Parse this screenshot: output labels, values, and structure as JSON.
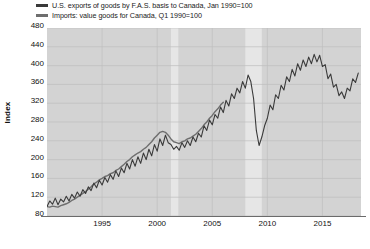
{
  "chart_data": {
    "type": "line",
    "title": "",
    "xlabel": "",
    "ylabel": "Index",
    "ylim": [
      80,
      480
    ],
    "xlim": [
      1990,
      2018.5
    ],
    "grid": true,
    "legend_position": "top-left",
    "yticks": [
      80,
      120,
      160,
      200,
      240,
      280,
      320,
      360,
      400,
      440,
      480
    ],
    "xticks": [
      1995,
      2000,
      2005,
      2010,
      2015
    ],
    "plot_background": "#d3d3d3",
    "gridline_color": "#bfbfbf",
    "recession_bands": [
      {
        "start": 2001.25,
        "end": 2001.92,
        "color": "#e6e6e6"
      },
      {
        "start": 2008.0,
        "end": 2009.5,
        "color": "#e6e6e6"
      }
    ],
    "series": [
      {
        "name": "U.S. exports of goods by F.A.S. basis to Canada, Jan 1990=100",
        "color": "#3a3a3a",
        "width": 1.1,
        "x": [
          1990.0,
          1990.25,
          1990.5,
          1990.75,
          1991.0,
          1991.25,
          1991.5,
          1991.75,
          1992.0,
          1992.25,
          1992.5,
          1992.75,
          1993.0,
          1993.25,
          1993.5,
          1993.75,
          1994.0,
          1994.25,
          1994.5,
          1994.75,
          1995.0,
          1995.25,
          1995.5,
          1995.75,
          1996.0,
          1996.25,
          1996.5,
          1996.75,
          1997.0,
          1997.25,
          1997.5,
          1997.75,
          1998.0,
          1998.25,
          1998.5,
          1998.75,
          1999.0,
          1999.25,
          1999.5,
          1999.75,
          2000.0,
          2000.25,
          2000.5,
          2000.75,
          2001.0,
          2001.25,
          2001.5,
          2001.75,
          2002.0,
          2002.25,
          2002.5,
          2002.75,
          2003.0,
          2003.25,
          2003.5,
          2003.75,
          2004.0,
          2004.25,
          2004.5,
          2004.75,
          2005.0,
          2005.25,
          2005.5,
          2005.75,
          2006.0,
          2006.25,
          2006.5,
          2006.75,
          2007.0,
          2007.25,
          2007.5,
          2007.75,
          2008.0,
          2008.25,
          2008.5,
          2008.75,
          2009.0,
          2009.25,
          2009.5,
          2009.75,
          2010.0,
          2010.25,
          2010.5,
          2010.75,
          2011.0,
          2011.25,
          2011.5,
          2011.75,
          2012.0,
          2012.25,
          2012.5,
          2012.75,
          2013.0,
          2013.25,
          2013.5,
          2013.75,
          2014.0,
          2014.25,
          2014.5,
          2014.75,
          2015.0,
          2015.25,
          2015.5,
          2015.75,
          2016.0,
          2016.25,
          2016.5,
          2016.75,
          2017.0,
          2017.25,
          2017.5,
          2017.75,
          2018.0,
          2018.25
        ],
        "values": [
          100,
          112,
          105,
          118,
          104,
          116,
          110,
          122,
          112,
          126,
          118,
          131,
          122,
          136,
          128,
          142,
          134,
          150,
          140,
          156,
          146,
          162,
          152,
          168,
          158,
          176,
          164,
          182,
          172,
          192,
          180,
          200,
          186,
          206,
          192,
          214,
          200,
          222,
          208,
          232,
          218,
          244,
          230,
          252,
          236,
          232,
          222,
          228,
          220,
          236,
          226,
          240,
          230,
          248,
          238,
          256,
          248,
          272,
          262,
          284,
          274,
          296,
          288,
          312,
          300,
          326,
          314,
          340,
          330,
          352,
          342,
          366,
          352,
          380,
          366,
          330,
          262,
          230,
          248,
          272,
          288,
          316,
          306,
          338,
          330,
          358,
          348,
          376,
          366,
          392,
          378,
          404,
          390,
          412,
          398,
          418,
          404,
          424,
          408,
          422,
          398,
          402,
          372,
          382,
          354,
          360,
          336,
          344,
          330,
          352,
          346,
          372,
          364,
          384
        ]
      },
      {
        "name": "Imports: value goods for Canada, Q1 1990=100",
        "color": "#6e6e6e",
        "width": 1.4,
        "x": [
          1990.0,
          1990.25,
          1990.5,
          1990.75,
          1991.0,
          1991.25,
          1991.5,
          1991.75,
          1992.0,
          1992.25,
          1992.5,
          1992.75,
          1993.0,
          1993.25,
          1993.5,
          1993.75,
          1994.0,
          1994.25,
          1994.5,
          1994.75,
          1995.0,
          1995.25,
          1995.5,
          1995.75,
          1996.0,
          1996.25,
          1996.5,
          1996.75,
          1997.0,
          1997.25,
          1997.5,
          1997.75,
          1998.0,
          1998.25,
          1998.5,
          1998.75,
          1999.0,
          1999.25,
          1999.5,
          1999.75,
          2000.0,
          2000.25,
          2000.5,
          2000.75,
          2001.0,
          2001.25,
          2001.5,
          2001.75,
          2002.0,
          2002.25,
          2002.5,
          2002.75,
          2003.0,
          2003.25,
          2003.5,
          2003.75,
          2004.0,
          2004.25,
          2004.5,
          2004.75,
          2005.0,
          2005.25,
          2005.5,
          2005.75,
          2006.0
        ],
        "values": [
          100,
          99,
          101,
          100,
          99,
          102,
          104,
          106,
          109,
          113,
          116,
          120,
          124,
          128,
          132,
          137,
          142,
          148,
          152,
          157,
          160,
          164,
          166,
          170,
          172,
          177,
          180,
          185,
          190,
          196,
          200,
          206,
          210,
          214,
          217,
          222,
          226,
          232,
          238,
          246,
          252,
          258,
          260,
          258,
          252,
          244,
          238,
          236,
          234,
          238,
          240,
          244,
          246,
          250,
          254,
          260,
          266,
          274,
          280,
          288,
          294,
          302,
          308,
          316,
          322
        ]
      }
    ]
  },
  "legend": {
    "items": [
      {
        "label": "U.S. exports of goods by F.A.S. basis to Canada, Jan 1990=100",
        "color": "#3a3a3a"
      },
      {
        "label": "Imports: value goods for Canada, Q1 1990=100",
        "color": "#6e6e6e"
      }
    ]
  },
  "axes": {
    "y_title": "Index",
    "y_ticks": [
      "480",
      "440",
      "400",
      "360",
      "320",
      "280",
      "240",
      "200",
      "160",
      "120",
      "80"
    ],
    "x_ticks": [
      "1995",
      "2000",
      "2005",
      "2010",
      "2015"
    ]
  }
}
